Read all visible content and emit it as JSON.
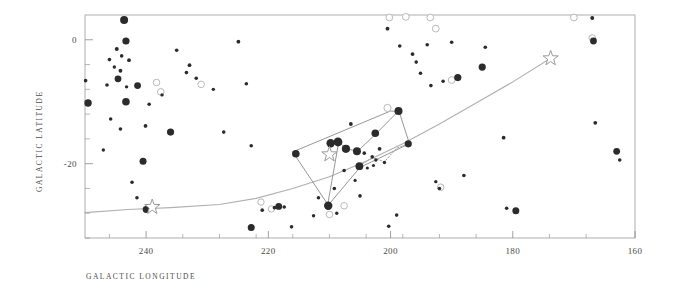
{
  "chart_data": {
    "type": "scatter",
    "title": "",
    "xlabel": "GALACTIC LONGITUDE",
    "ylabel": "GALACTIC LATITUDE",
    "xlim": [
      250,
      160
    ],
    "ylim": [
      -32,
      4
    ],
    "x_ticks_major": [
      240,
      220,
      200,
      180,
      160
    ],
    "x_tick_labels": [
      "240",
      "220",
      "200",
      "180",
      "160"
    ],
    "x_ticks_minor": [
      246,
      234,
      228,
      222,
      216,
      210,
      204,
      198,
      192,
      186,
      174,
      168
    ],
    "y_ticks_major": [
      0,
      -20
    ],
    "y_tick_labels": [
      "0",
      "-20"
    ],
    "y_ticks_minor": [
      -4,
      -8,
      -12,
      -16,
      -24,
      -28,
      -32
    ],
    "grid": false,
    "legend": null,
    "axis_direction_note": "longitude decreases left to right",
    "series": [
      {
        "name": "bright-stars-filled",
        "marker": "filled-circle",
        "color": "#2b2b2b",
        "points": [
          {
            "l": 243.6,
            "b": 3.2,
            "r": 4.0
          },
          {
            "l": 243.3,
            "b": -0.2,
            "r": 3.6
          },
          {
            "l": 244.6,
            "b": -6.3,
            "r": 3.4
          },
          {
            "l": 241.4,
            "b": -7.4,
            "r": 3.4
          },
          {
            "l": 243.3,
            "b": -10.0,
            "r": 3.8
          },
          {
            "l": 249.5,
            "b": -10.2,
            "r": 3.7
          },
          {
            "l": 240.5,
            "b": -19.6,
            "r": 3.5
          },
          {
            "l": 236.0,
            "b": -14.9,
            "r": 3.6
          },
          {
            "l": 240.0,
            "b": -27.4,
            "r": 3.4
          },
          {
            "l": 222.8,
            "b": -30.3,
            "r": 3.5
          },
          {
            "l": 218.3,
            "b": -26.9,
            "r": 3.4
          },
          {
            "l": 215.5,
            "b": -18.4,
            "r": 3.8
          },
          {
            "l": 210.2,
            "b": -26.8,
            "r": 4.2
          },
          {
            "l": 209.8,
            "b": -16.7,
            "r": 4.2
          },
          {
            "l": 208.6,
            "b": -16.5,
            "r": 4.4
          },
          {
            "l": 207.3,
            "b": -17.6,
            "r": 4.1
          },
          {
            "l": 205.5,
            "b": -18.0,
            "r": 4.0
          },
          {
            "l": 205.1,
            "b": -20.4,
            "r": 3.9
          },
          {
            "l": 202.5,
            "b": -15.1,
            "r": 3.8
          },
          {
            "l": 198.7,
            "b": -11.5,
            "r": 4.0
          },
          {
            "l": 197.1,
            "b": -16.8,
            "r": 3.6
          },
          {
            "l": 189.0,
            "b": -6.1,
            "r": 3.6
          },
          {
            "l": 185.0,
            "b": -4.4,
            "r": 3.6
          },
          {
            "l": 179.5,
            "b": -27.6,
            "r": 3.5
          },
          {
            "l": 166.8,
            "b": -0.2,
            "r": 3.4
          },
          {
            "l": 163.0,
            "b": -18.0,
            "r": 3.4
          },
          {
            "l": 167.0,
            "b": 3.5,
            "r": 2.0
          }
        ]
      },
      {
        "name": "faint-stars-filled",
        "marker": "filled-circle-small",
        "color": "#2b2b2b",
        "points": [
          {
            "l": 249.9,
            "b": -6.6,
            "r": 1.8
          },
          {
            "l": 244.8,
            "b": -1.5,
            "r": 2.0
          },
          {
            "l": 244.0,
            "b": -2.6,
            "r": 1.8
          },
          {
            "l": 245.2,
            "b": -4.4,
            "r": 1.7
          },
          {
            "l": 244.2,
            "b": -5.0,
            "r": 1.9
          },
          {
            "l": 246.0,
            "b": -3.2,
            "r": 1.8
          },
          {
            "l": 242.8,
            "b": -3.3,
            "r": 1.9
          },
          {
            "l": 246.4,
            "b": -7.3,
            "r": 1.8
          },
          {
            "l": 243.2,
            "b": -7.6,
            "r": 1.7
          },
          {
            "l": 245.8,
            "b": -12.8,
            "r": 1.8
          },
          {
            "l": 247.0,
            "b": -17.8,
            "r": 1.7
          },
          {
            "l": 244.2,
            "b": -14.4,
            "r": 1.8
          },
          {
            "l": 240.1,
            "b": -13.9,
            "r": 1.9
          },
          {
            "l": 242.3,
            "b": -23.0,
            "r": 1.8
          },
          {
            "l": 241.5,
            "b": -25.5,
            "r": 1.8
          },
          {
            "l": 239.5,
            "b": -10.4,
            "r": 1.8
          },
          {
            "l": 237.4,
            "b": -8.9,
            "r": 1.7
          },
          {
            "l": 235.0,
            "b": -1.7,
            "r": 1.8
          },
          {
            "l": 233.4,
            "b": -5.3,
            "r": 1.8
          },
          {
            "l": 232.9,
            "b": -4.1,
            "r": 1.9
          },
          {
            "l": 231.8,
            "b": -6.2,
            "r": 1.8
          },
          {
            "l": 229.0,
            "b": -8.0,
            "r": 1.7
          },
          {
            "l": 227.3,
            "b": -14.9,
            "r": 1.8
          },
          {
            "l": 224.9,
            "b": -0.3,
            "r": 1.9
          },
          {
            "l": 223.6,
            "b": -7.1,
            "r": 1.8
          },
          {
            "l": 222.8,
            "b": -17.1,
            "r": 1.8
          },
          {
            "l": 221.0,
            "b": -27.5,
            "r": 1.8
          },
          {
            "l": 219.0,
            "b": -27.1,
            "r": 1.8
          },
          {
            "l": 217.4,
            "b": -27.0,
            "r": 1.8
          },
          {
            "l": 216.2,
            "b": -30.2,
            "r": 1.8
          },
          {
            "l": 212.6,
            "b": -28.4,
            "r": 1.7
          },
          {
            "l": 211.8,
            "b": -25.5,
            "r": 1.8
          },
          {
            "l": 209.2,
            "b": -24.0,
            "r": 1.8
          },
          {
            "l": 208.8,
            "b": -28.0,
            "r": 1.7
          },
          {
            "l": 207.6,
            "b": -21.1,
            "r": 1.8
          },
          {
            "l": 206.5,
            "b": -13.6,
            "r": 1.9
          },
          {
            "l": 205.0,
            "b": -25.2,
            "r": 1.8
          },
          {
            "l": 204.3,
            "b": -18.3,
            "r": 1.8
          },
          {
            "l": 203.0,
            "b": -18.9,
            "r": 1.8
          },
          {
            "l": 202.4,
            "b": -19.4,
            "r": 1.7
          },
          {
            "l": 201.8,
            "b": -17.6,
            "r": 1.9
          },
          {
            "l": 201.0,
            "b": -19.8,
            "r": 1.7
          },
          {
            "l": 200.3,
            "b": -30.1,
            "r": 1.8
          },
          {
            "l": 199.0,
            "b": -28.3,
            "r": 1.8
          },
          {
            "l": 200.5,
            "b": 1.8,
            "r": 1.9
          },
          {
            "l": 198.5,
            "b": -1.0,
            "r": 1.8
          },
          {
            "l": 196.4,
            "b": -2.3,
            "r": 1.9
          },
          {
            "l": 195.8,
            "b": -3.6,
            "r": 1.8
          },
          {
            "l": 195.1,
            "b": -5.4,
            "r": 1.8
          },
          {
            "l": 194.0,
            "b": -0.8,
            "r": 1.8
          },
          {
            "l": 193.4,
            "b": -7.4,
            "r": 1.8
          },
          {
            "l": 192.0,
            "b": -24.0,
            "r": 1.8
          },
          {
            "l": 192.6,
            "b": -22.9,
            "r": 1.7
          },
          {
            "l": 191.4,
            "b": -6.7,
            "r": 1.8
          },
          {
            "l": 190.0,
            "b": -0.4,
            "r": 1.8
          },
          {
            "l": 188.0,
            "b": -21.9,
            "r": 1.8
          },
          {
            "l": 184.5,
            "b": -1.2,
            "r": 1.8
          },
          {
            "l": 181.5,
            "b": -15.8,
            "r": 1.9
          },
          {
            "l": 181.0,
            "b": -27.2,
            "r": 1.8
          },
          {
            "l": 166.5,
            "b": -13.4,
            "r": 1.9
          },
          {
            "l": 162.5,
            "b": -19.4,
            "r": 1.8
          },
          {
            "l": 205.8,
            "b": -22.7,
            "r": 1.6
          },
          {
            "l": 203.8,
            "b": -20.7,
            "r": 1.6
          },
          {
            "l": 202.8,
            "b": -20.3,
            "r": 1.6
          }
        ]
      },
      {
        "name": "open-circles",
        "marker": "open-circle",
        "color": "#b9b9b9",
        "points": [
          {
            "l": 239.6,
            "b": -27.1,
            "r": 3.3
          },
          {
            "l": 237.6,
            "b": -8.4,
            "r": 3.3
          },
          {
            "l": 238.3,
            "b": -6.9,
            "r": 3.3
          },
          {
            "l": 231.0,
            "b": -7.2,
            "r": 3.3
          },
          {
            "l": 221.2,
            "b": -26.2,
            "r": 3.2
          },
          {
            "l": 219.5,
            "b": -27.3,
            "r": 3.2
          },
          {
            "l": 207.6,
            "b": -26.8,
            "r": 3.3
          },
          {
            "l": 210.0,
            "b": -28.2,
            "r": 3.3
          },
          {
            "l": 200.5,
            "b": -11.0,
            "r": 3.6
          },
          {
            "l": 200.2,
            "b": 3.6,
            "r": 3.4
          },
          {
            "l": 197.5,
            "b": 3.7,
            "r": 3.4
          },
          {
            "l": 193.5,
            "b": 3.6,
            "r": 3.4
          },
          {
            "l": 192.6,
            "b": 1.8,
            "r": 3.4
          },
          {
            "l": 191.8,
            "b": -23.8,
            "r": 3.3
          },
          {
            "l": 190.0,
            "b": -6.5,
            "r": 3.4
          },
          {
            "l": 170.0,
            "b": 3.6,
            "r": 3.4
          },
          {
            "l": 167.0,
            "b": 0.3,
            "r": 3.3
          }
        ]
      },
      {
        "name": "named-stars",
        "marker": "star-outline",
        "color": "#9a9a9a",
        "points": [
          {
            "l": 239.0,
            "b": -27.0,
            "r": 8
          },
          {
            "l": 210.0,
            "b": -18.5,
            "r": 8
          },
          {
            "l": 173.8,
            "b": -3.0,
            "r": 8
          }
        ]
      }
    ],
    "constellation_lines": [
      {
        "name": "orion-outline",
        "color": "#8b8b8b",
        "path": [
          {
            "l": 216.0,
            "b": -18.1
          },
          {
            "l": 200.0,
            "b": -11.5
          },
          {
            "l": 198.6,
            "b": -11.6
          },
          {
            "l": 196.9,
            "b": -16.8
          },
          {
            "l": 197.2,
            "b": -16.9
          },
          {
            "l": 205.0,
            "b": -20.6
          },
          {
            "l": 210.2,
            "b": -26.7
          },
          {
            "l": 216.0,
            "b": -18.1
          }
        ]
      },
      {
        "name": "orion-belt-chain",
        "color": "#8b8b8b",
        "path": [
          {
            "l": 209.8,
            "b": -16.7
          },
          {
            "l": 208.5,
            "b": -16.5
          },
          {
            "l": 207.2,
            "b": -17.6
          },
          {
            "l": 205.4,
            "b": -18.0
          },
          {
            "l": 202.4,
            "b": -15.2
          },
          {
            "l": 198.7,
            "b": -11.5
          }
        ]
      },
      {
        "name": "orion-sword",
        "color": "#8b8b8b",
        "path": [
          {
            "l": 208.5,
            "b": -16.6
          },
          {
            "l": 210.3,
            "b": -26.7
          }
        ]
      },
      {
        "name": "belt-dotted-lower",
        "color": "#9a9a9a",
        "dashed": true,
        "path": [
          {
            "l": 205.1,
            "b": -20.4
          },
          {
            "l": 203.0,
            "b": -19.0
          },
          {
            "l": 201.0,
            "b": -19.7
          },
          {
            "l": 199.0,
            "b": -17.5
          },
          {
            "l": 197.1,
            "b": -16.8
          }
        ]
      }
    ],
    "overlay_curve": {
      "name": "gould-belt-arc",
      "color": "#b0b0b0",
      "points": [
        {
          "l": 250.0,
          "b": -27.9
        },
        {
          "l": 243.0,
          "b": -27.4
        },
        {
          "l": 236.0,
          "b": -27.1
        },
        {
          "l": 228.0,
          "b": -26.6
        },
        {
          "l": 222.0,
          "b": -25.6
        },
        {
          "l": 216.0,
          "b": -24.0
        },
        {
          "l": 210.0,
          "b": -22.1
        },
        {
          "l": 204.0,
          "b": -19.6
        },
        {
          "l": 198.0,
          "b": -16.8
        },
        {
          "l": 192.0,
          "b": -13.6
        },
        {
          "l": 186.0,
          "b": -10.2
        },
        {
          "l": 180.0,
          "b": -6.8
        },
        {
          "l": 174.0,
          "b": -3.1
        }
      ]
    }
  },
  "plot": {
    "frame_color": "#999999",
    "background": "#ffffff",
    "left_px": 85,
    "right_px": 635,
    "top_px": 15,
    "bottom_px": 238
  }
}
